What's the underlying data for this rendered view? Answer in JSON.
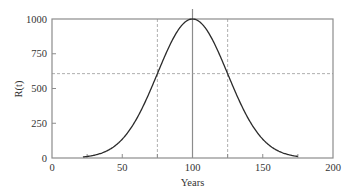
{
  "chart_data": {
    "type": "line",
    "title": "",
    "xlabel": "Years",
    "ylabel": "R(t)",
    "xlim": [
      0,
      200
    ],
    "ylim": [
      0,
      1000
    ],
    "x_ticks": [
      0,
      50,
      100,
      150,
      200
    ],
    "x_tick_labels": [
      "0",
      "50",
      "100",
      "150",
      "200"
    ],
    "x_minor_ticks": [
      25,
      75,
      125,
      175
    ],
    "y_ticks": [
      0,
      250,
      500,
      750,
      1000
    ],
    "y_tick_labels": [
      "0",
      "250",
      "500",
      "750",
      "1000"
    ],
    "grid": false,
    "legend": null,
    "series": [
      {
        "name": "R(t)",
        "description": "Bell-shaped (Gaussian) curve, peak 1000 at t=100, sigma 25",
        "peak": 1000,
        "mean": 100,
        "sigma": 25,
        "x": [
          22,
          25,
          30,
          40,
          50,
          60,
          70,
          75,
          80,
          90,
          100,
          110,
          120,
          125,
          130,
          140,
          150,
          160,
          170,
          175
        ],
        "values": [
          8,
          11,
          20,
          56,
          135,
          278,
          487,
          607,
          726,
          923,
          1000,
          923,
          726,
          607,
          487,
          278,
          135,
          56,
          20,
          11
        ]
      }
    ],
    "reference_lines": [
      {
        "orientation": "vertical",
        "x": 100,
        "style": "solid"
      },
      {
        "orientation": "vertical",
        "x": 75,
        "style": "dashed"
      },
      {
        "orientation": "vertical",
        "x": 125,
        "style": "dashed"
      },
      {
        "orientation": "horizontal",
        "y": 607,
        "style": "dashed"
      }
    ],
    "colors": {
      "curve": "#2b2b2b",
      "axes": "#8c8c8c",
      "reference_solid": "#8c8c8c",
      "reference_dashed": "#9a9a9a"
    }
  }
}
